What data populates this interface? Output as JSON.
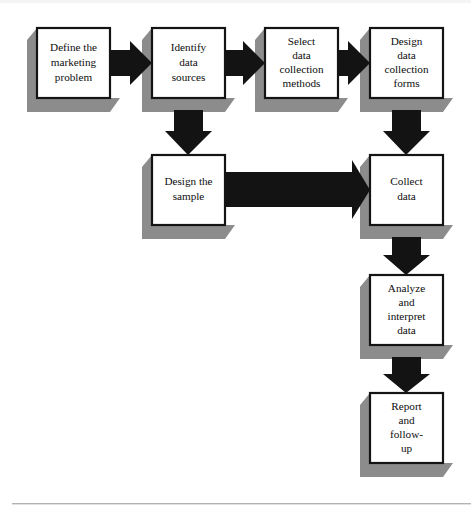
{
  "diagram": {
    "type": "flowchart",
    "orientation": "left-to-right then top-to-bottom",
    "colors": {
      "box_fill": "#ffffff",
      "box_border": "#141414",
      "shadow": "#8c8c8c",
      "arrow": "#131313",
      "text": "#0d0d0d",
      "footer_rule": "#b3b3b3",
      "background": "#ffffff"
    },
    "nodes": [
      {
        "id": "define-marketing-problem",
        "label": "Define the marketing problem",
        "lines": [
          "Define the",
          "marketing",
          "problem"
        ],
        "step": 1,
        "x": 37,
        "y": 28,
        "w": 73,
        "h": 70
      },
      {
        "id": "identify-data-sources",
        "label": "Identify data sources",
        "lines": [
          "Identify",
          "data",
          "sources"
        ],
        "step": 2,
        "x": 152,
        "y": 28,
        "w": 73,
        "h": 70
      },
      {
        "id": "select-data-collection-methods",
        "label": "Select data collection methods",
        "lines": [
          "Select",
          "data",
          "collection",
          "methods"
        ],
        "step": 3,
        "x": 265,
        "y": 28,
        "w": 73,
        "h": 70
      },
      {
        "id": "design-data-collection-forms",
        "label": "Design data collection forms",
        "lines": [
          "Design",
          "data",
          "collection",
          "forms"
        ],
        "step": 4,
        "x": 370,
        "y": 28,
        "w": 73,
        "h": 70
      },
      {
        "id": "design-the-sample",
        "label": "Design the sample",
        "lines": [
          "Design the",
          "sample"
        ],
        "step": 5,
        "x": 152,
        "y": 155,
        "w": 73,
        "h": 70
      },
      {
        "id": "collect-data",
        "label": "Collect data",
        "lines": [
          "Collect",
          "data"
        ],
        "step": 6,
        "x": 370,
        "y": 155,
        "w": 73,
        "h": 70
      },
      {
        "id": "analyze-and-interpret-data",
        "label": "Analyze and interpret data",
        "lines": [
          "Analyze",
          "and",
          "interpret",
          "data"
        ],
        "step": 7,
        "x": 370,
        "y": 275,
        "w": 73,
        "h": 70
      },
      {
        "id": "report-and-follow-up",
        "label": "Report and follow-up",
        "lines": [
          "Report",
          "and",
          "follow-",
          "up"
        ],
        "step": 8,
        "x": 370,
        "y": 393,
        "w": 73,
        "h": 70
      }
    ],
    "connectors": [
      {
        "id": "arrow-define-to-identify",
        "from": "define-marketing-problem",
        "to": "identify-data-sources",
        "direction": "right"
      },
      {
        "id": "arrow-identify-to-select",
        "from": "identify-data-sources",
        "to": "select-data-collection-methods",
        "direction": "right"
      },
      {
        "id": "arrow-select-to-design-forms",
        "from": "select-data-collection-methods",
        "to": "design-data-collection-forms",
        "direction": "right"
      },
      {
        "id": "arrow-identify-to-design-sample",
        "from": "identify-data-sources",
        "to": "design-the-sample",
        "direction": "down"
      },
      {
        "id": "arrow-design-forms-to-collect",
        "from": "design-data-collection-forms",
        "to": "collect-data",
        "direction": "down"
      },
      {
        "id": "arrow-design-sample-to-collect",
        "from": "design-the-sample",
        "to": "collect-data",
        "direction": "right-long"
      },
      {
        "id": "arrow-collect-to-analyze",
        "from": "collect-data",
        "to": "analyze-and-interpret-data",
        "direction": "down"
      },
      {
        "id": "arrow-analyze-to-report",
        "from": "analyze-and-interpret-data",
        "to": "report-and-follow-up",
        "direction": "down"
      }
    ],
    "footer_rule": {
      "x": 12,
      "y": 503,
      "width": 459,
      "height": 1.4
    }
  }
}
